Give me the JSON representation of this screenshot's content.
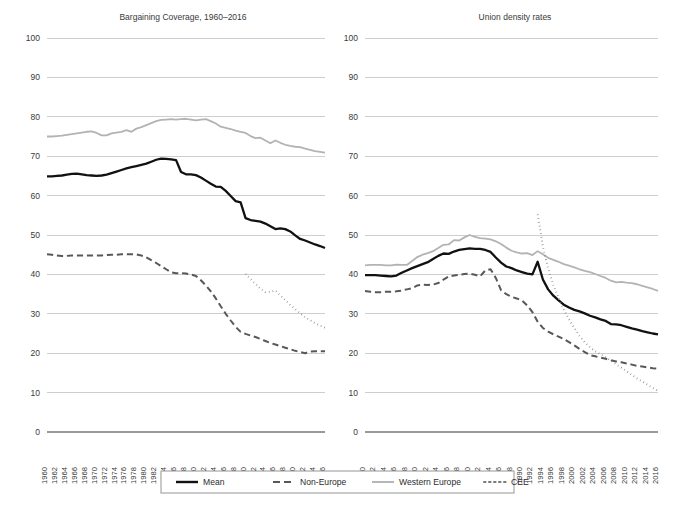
{
  "figure": {
    "caption_fragment": "",
    "background": "#ffffff"
  },
  "legend": {
    "position": "bottom-center",
    "entries": [
      {
        "label": "Mean",
        "color": "#111111",
        "style": "solid",
        "width": 2.3
      },
      {
        "label": "Non-Europe",
        "color": "#585858",
        "style": "dashed",
        "width": 2.0
      },
      {
        "label": "Western Europe",
        "color": "#b3b3b3",
        "style": "solid",
        "width": 1.8
      },
      {
        "label": "CEE",
        "color": "#7a7a7a",
        "style": "dotted",
        "width": 1.8
      }
    ]
  },
  "axes": {
    "y_ticks": [
      100,
      90,
      80,
      70,
      60,
      50,
      40,
      30,
      20,
      10,
      0
    ],
    "ylim": [
      0,
      100
    ],
    "x_ticks": [
      1960,
      1962,
      1964,
      1966,
      1968,
      1970,
      1972,
      1974,
      1976,
      1978,
      1980,
      1982,
      1984,
      1986,
      1988,
      1990,
      1992,
      1994,
      1996,
      1998,
      2000,
      2002,
      2004,
      2006,
      2008,
      2010,
      2012,
      2014,
      2016
    ],
    "xlim": [
      1960,
      2016
    ],
    "grid": true,
    "xlabel": "",
    "ylabel": ""
  },
  "chart_data": [
    {
      "type": "line",
      "title": "Bargaining Coverage, 1960–2016",
      "xlabel": "",
      "ylabel": "",
      "ylim": [
        0,
        100
      ],
      "xlim": [
        1960,
        2016
      ],
      "grid": true,
      "legend_position": "bottom",
      "x": [
        1960,
        1961,
        1962,
        1963,
        1964,
        1965,
        1966,
        1967,
        1968,
        1969,
        1970,
        1971,
        1972,
        1973,
        1974,
        1975,
        1976,
        1977,
        1978,
        1979,
        1980,
        1981,
        1982,
        1983,
        1984,
        1985,
        1986,
        1987,
        1988,
        1989,
        1990,
        1991,
        1992,
        1993,
        1994,
        1995,
        1996,
        1997,
        1998,
        1999,
        2000,
        2001,
        2002,
        2003,
        2004,
        2005,
        2006,
        2007,
        2008,
        2009,
        2010,
        2011,
        2012,
        2013,
        2014,
        2015,
        2016
      ],
      "series": [
        {
          "name": "Mean",
          "style": "solid",
          "color": "#111111",
          "values": [
            64.9,
            64.9,
            65.0,
            65.1,
            65.3,
            65.5,
            65.6,
            65.4,
            65.2,
            65.1,
            65.0,
            65.1,
            65.3,
            65.7,
            66.1,
            66.5,
            66.9,
            67.2,
            67.5,
            67.8,
            68.1,
            68.6,
            69.1,
            69.4,
            69.3,
            69.2,
            69.0,
            66.0,
            65.4,
            65.4,
            65.2,
            64.6,
            63.8,
            63.0,
            62.3,
            62.2,
            61.2,
            59.9,
            58.6,
            58.3,
            54.3,
            53.8,
            53.6,
            53.4,
            52.9,
            52.2,
            51.5,
            51.7,
            51.5,
            50.9,
            49.9,
            49.0,
            48.6,
            48.1,
            47.6,
            47.2,
            46.7
          ]
        },
        {
          "name": "Non-Europe",
          "style": "dashed",
          "color": "#585858",
          "values": [
            45.1,
            45.0,
            44.8,
            44.7,
            44.7,
            44.8,
            44.8,
            44.8,
            44.8,
            44.8,
            44.8,
            44.8,
            44.9,
            45.0,
            45.0,
            45.1,
            45.1,
            45.1,
            45.1,
            44.8,
            44.3,
            43.6,
            42.9,
            42.1,
            41.3,
            40.5,
            40.3,
            40.3,
            40.2,
            40.0,
            39.6,
            38.5,
            37.2,
            35.7,
            33.9,
            31.9,
            30.0,
            28.3,
            26.7,
            25.4,
            24.9,
            24.5,
            24.1,
            23.6,
            23.1,
            22.6,
            22.2,
            21.8,
            21.4,
            21.0,
            20.6,
            20.3,
            20.0,
            20.4,
            20.5,
            20.5,
            20.5
          ]
        },
        {
          "name": "Western Europe",
          "style": "solid",
          "color": "#b3b3b3",
          "values": [
            75.0,
            75.0,
            75.1,
            75.2,
            75.4,
            75.6,
            75.8,
            76.0,
            76.2,
            76.3,
            75.9,
            75.3,
            75.3,
            75.8,
            76.0,
            76.2,
            76.6,
            76.2,
            77.0,
            77.4,
            77.9,
            78.4,
            78.9,
            79.2,
            79.3,
            79.4,
            79.3,
            79.4,
            79.5,
            79.3,
            79.1,
            79.3,
            79.4,
            78.9,
            78.3,
            77.5,
            77.2,
            76.9,
            76.5,
            76.2,
            75.9,
            75.1,
            74.6,
            74.7,
            74.0,
            73.3,
            74.0,
            73.4,
            72.9,
            72.6,
            72.4,
            72.3,
            71.9,
            71.6,
            71.3,
            71.1,
            70.9
          ]
        },
        {
          "name": "CEE",
          "style": "dotted",
          "color": "#7a7a7a",
          "start_year": 2000,
          "values": [
            null,
            null,
            null,
            null,
            null,
            null,
            null,
            null,
            null,
            null,
            null,
            null,
            null,
            null,
            null,
            null,
            null,
            null,
            null,
            null,
            40.1,
            38.8,
            37.6,
            36.4,
            35.5,
            35.6,
            35.9,
            34.7,
            33.5,
            32.3,
            31.2,
            30.1,
            29.1,
            28.4,
            27.6,
            27.0,
            26.5
          ]
        }
      ]
    },
    {
      "type": "line",
      "title": "Union density rates",
      "xlabel": "",
      "ylabel": "",
      "ylim": [
        0,
        100
      ],
      "xlim": [
        1960,
        2016
      ],
      "grid": true,
      "legend_position": "bottom",
      "x": [
        1960,
        1961,
        1962,
        1963,
        1964,
        1965,
        1966,
        1967,
        1968,
        1969,
        1970,
        1971,
        1972,
        1973,
        1974,
        1975,
        1976,
        1977,
        1978,
        1979,
        1980,
        1981,
        1982,
        1983,
        1984,
        1985,
        1986,
        1987,
        1988,
        1989,
        1990,
        1991,
        1992,
        1993,
        1994,
        1995,
        1996,
        1997,
        1998,
        1999,
        2000,
        2001,
        2002,
        2003,
        2004,
        2005,
        2006,
        2007,
        2008,
        2009,
        2010,
        2011,
        2012,
        2013,
        2014,
        2015,
        2016
      ],
      "series": [
        {
          "name": "Mean",
          "style": "solid",
          "color": "#111111",
          "values": [
            39.8,
            39.8,
            39.8,
            39.7,
            39.6,
            39.5,
            39.7,
            40.4,
            41.0,
            41.6,
            42.1,
            42.6,
            43.1,
            43.9,
            44.7,
            45.3,
            45.2,
            45.8,
            46.2,
            46.4,
            46.6,
            46.5,
            46.5,
            46.2,
            45.7,
            44.3,
            43.0,
            42.0,
            41.6,
            41.0,
            40.6,
            40.2,
            40.0,
            43.2,
            38.7,
            36.2,
            34.6,
            33.4,
            32.3,
            31.6,
            31.0,
            30.6,
            30.1,
            29.5,
            29.1,
            28.6,
            28.2,
            27.4,
            27.3,
            27.1,
            26.7,
            26.3,
            26.0,
            25.6,
            25.3,
            25.0,
            24.8
          ]
        },
        {
          "name": "Non-Europe",
          "style": "dashed",
          "color": "#585858",
          "values": [
            35.8,
            35.6,
            35.5,
            35.5,
            35.6,
            35.6,
            35.7,
            35.9,
            36.2,
            36.5,
            37.2,
            37.4,
            37.3,
            37.4,
            37.8,
            38.7,
            39.5,
            39.7,
            39.9,
            40.1,
            40.2,
            39.9,
            39.5,
            41.0,
            41.3,
            39.1,
            36.0,
            35.0,
            34.3,
            33.9,
            33.4,
            32.1,
            30.4,
            28.0,
            26.4,
            25.5,
            24.8,
            24.2,
            23.6,
            22.8,
            22.0,
            21.1,
            20.3,
            19.5,
            19.2,
            18.9,
            18.6,
            18.2,
            17.9,
            17.7,
            17.4,
            17.1,
            16.8,
            16.6,
            16.4,
            16.2,
            16.1
          ]
        },
        {
          "name": "Western Europe",
          "style": "solid",
          "color": "#b3b3b3",
          "values": [
            42.3,
            42.4,
            42.4,
            42.4,
            42.3,
            42.3,
            42.5,
            42.4,
            42.4,
            43.4,
            44.4,
            45.0,
            45.4,
            45.9,
            46.7,
            47.5,
            47.6,
            48.7,
            48.6,
            49.4,
            50.0,
            49.5,
            49.2,
            49.1,
            48.9,
            48.4,
            47.7,
            46.8,
            46.0,
            45.6,
            45.3,
            45.4,
            44.9,
            45.9,
            45.1,
            44.2,
            43.7,
            43.2,
            42.6,
            42.2,
            41.8,
            41.3,
            40.9,
            40.6,
            40.1,
            39.6,
            39.1,
            38.4,
            38.0,
            38.1,
            37.9,
            37.8,
            37.5,
            37.1,
            36.7,
            36.3,
            35.8
          ]
        },
        {
          "name": "CEE",
          "style": "dotted",
          "color": "#7a7a7a",
          "start_year": 1993,
          "values": [
            null,
            null,
            null,
            null,
            null,
            null,
            null,
            null,
            null,
            null,
            null,
            null,
            null,
            null,
            null,
            null,
            null,
            null,
            null,
            null,
            null,
            null,
            null,
            null,
            null,
            null,
            null,
            null,
            null,
            null,
            null,
            null,
            null,
            55.2,
            47.0,
            41.5,
            37.3,
            34.0,
            31.0,
            28.6,
            26.4,
            24.4,
            22.8,
            21.5,
            20.5,
            19.7,
            19.0,
            18.1,
            17.2,
            16.3,
            15.4,
            14.5,
            13.6,
            12.8,
            12.0,
            11.2,
            10.5
          ]
        }
      ]
    }
  ]
}
